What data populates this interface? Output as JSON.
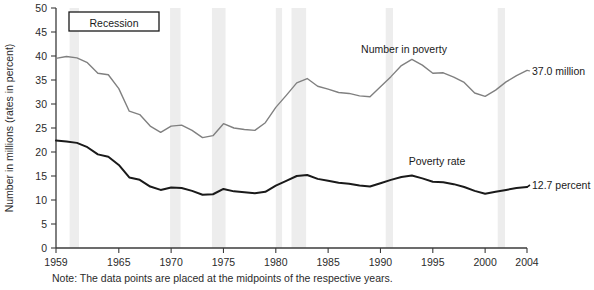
{
  "chart_data": {
    "type": "line",
    "title": "",
    "xlabel": "",
    "ylabel": "Number in millions (rates in percent)",
    "xlim": [
      1959,
      2004
    ],
    "ylim": [
      0,
      50
    ],
    "grid": false,
    "legend_position": "inline-annotations",
    "x_tick_labels": [
      "1959",
      "1965",
      "1970",
      "1975",
      "1980",
      "1985",
      "1990",
      "1995",
      "2000",
      "2004"
    ],
    "x_ticks": [
      1959,
      1965,
      1970,
      1975,
      1980,
      1985,
      1990,
      1995,
      2000,
      2004
    ],
    "y_tick_labels": [
      "0",
      "5",
      "10",
      "15",
      "20",
      "25",
      "30",
      "35",
      "40",
      "45",
      "50"
    ],
    "y_ticks": [
      0,
      5,
      10,
      15,
      20,
      25,
      30,
      35,
      40,
      45,
      50
    ],
    "x": [
      1959,
      1960,
      1961,
      1962,
      1963,
      1964,
      1965,
      1966,
      1967,
      1968,
      1969,
      1970,
      1971,
      1972,
      1973,
      1974,
      1975,
      1976,
      1977,
      1978,
      1979,
      1980,
      1981,
      1982,
      1983,
      1984,
      1985,
      1986,
      1987,
      1988,
      1989,
      1990,
      1991,
      1992,
      1993,
      1994,
      1995,
      1996,
      1997,
      1998,
      1999,
      2000,
      2001,
      2002,
      2003,
      2004
    ],
    "series": [
      {
        "name": "Number in poverty",
        "units": "millions",
        "color": "#808080",
        "label_text": "Number in poverty",
        "end_label": "37.0 million",
        "values": [
          39.5,
          39.9,
          39.6,
          38.6,
          36.4,
          36.1,
          33.2,
          28.5,
          27.8,
          25.4,
          24.1,
          25.4,
          25.6,
          24.5,
          23.0,
          23.4,
          25.9,
          25.0,
          24.7,
          24.5,
          26.1,
          29.3,
          31.8,
          34.4,
          35.3,
          33.7,
          33.1,
          32.4,
          32.2,
          31.7,
          31.5,
          33.6,
          35.7,
          38.0,
          39.3,
          38.1,
          36.4,
          36.5,
          35.6,
          34.5,
          32.3,
          31.6,
          32.9,
          34.6,
          35.9,
          37.0
        ]
      },
      {
        "name": "Poverty rate",
        "units": "percent",
        "color": "#1a1a1a",
        "label_text": "Poverty rate",
        "end_label": "12.7 percent",
        "values": [
          22.4,
          22.2,
          21.9,
          21.0,
          19.5,
          19.0,
          17.3,
          14.7,
          14.2,
          12.8,
          12.1,
          12.6,
          12.5,
          11.9,
          11.1,
          11.2,
          12.3,
          11.8,
          11.6,
          11.4,
          11.7,
          13.0,
          14.0,
          15.0,
          15.2,
          14.4,
          14.0,
          13.6,
          13.4,
          13.0,
          12.8,
          13.5,
          14.2,
          14.8,
          15.1,
          14.5,
          13.8,
          13.7,
          13.3,
          12.7,
          11.9,
          11.3,
          11.7,
          12.1,
          12.5,
          12.7
        ]
      }
    ],
    "recession_bands": [
      {
        "start": 1960.3,
        "end": 1961.2
      },
      {
        "start": 1969.9,
        "end": 1970.9
      },
      {
        "start": 1973.9,
        "end": 1975.2
      },
      {
        "start": 1980.0,
        "end": 1980.6
      },
      {
        "start": 1981.5,
        "end": 1982.9
      },
      {
        "start": 1990.5,
        "end": 1991.2
      },
      {
        "start": 2001.2,
        "end": 2001.9
      }
    ],
    "recession_band_color": "#ededed"
  },
  "legend": {
    "label": "Recession"
  },
  "note": {
    "text": "Note:  The data points are placed at the midpoints of the respective years."
  }
}
